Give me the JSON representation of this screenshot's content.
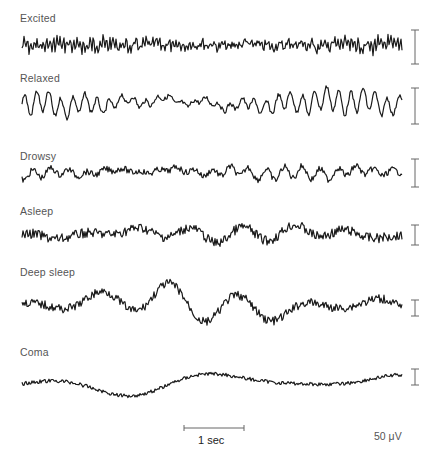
{
  "figure": {
    "ink_color": "#1a1a1a",
    "scale_color": "#666666"
  },
  "traces": [
    {
      "label": "Excited",
      "label_y": 12,
      "baseline": 45,
      "amp": 5,
      "freq": 1.9,
      "noise": 0.9,
      "scale_top": 30,
      "scale_bottom": 64
    },
    {
      "label": "Relaxed",
      "label_y": 72,
      "baseline": 103,
      "amp": 11,
      "freq": 0.52,
      "noise": 0.2,
      "scale_top": 88,
      "scale_bottom": 124
    },
    {
      "label": "Drowsy",
      "label_y": 150,
      "baseline": 172,
      "amp": 6,
      "freq": 0.35,
      "noise": 0.5,
      "scale_top": 159,
      "scale_bottom": 187
    },
    {
      "label": "Asleep",
      "label_y": 205,
      "baseline": 235,
      "amp": 8,
      "freq": 0.12,
      "noise": 0.6,
      "scale_top": 225,
      "scale_bottom": 245
    },
    {
      "label": "Deep sleep",
      "label_y": 266,
      "baseline": 305,
      "amp": 17,
      "freq": 0.09,
      "noise": 0.25,
      "scale_top": 300,
      "scale_bottom": 316
    },
    {
      "label": "Coma",
      "label_y": 346,
      "baseline": 382,
      "amp": 12,
      "freq": 0.035,
      "noise": 0.15,
      "scale_top": 369,
      "scale_bottom": 385
    }
  ],
  "time_scale": {
    "label": "1 sec",
    "x1": 184,
    "x2": 244,
    "y": 428
  },
  "amplitude_scale": {
    "label": "50 μV"
  }
}
